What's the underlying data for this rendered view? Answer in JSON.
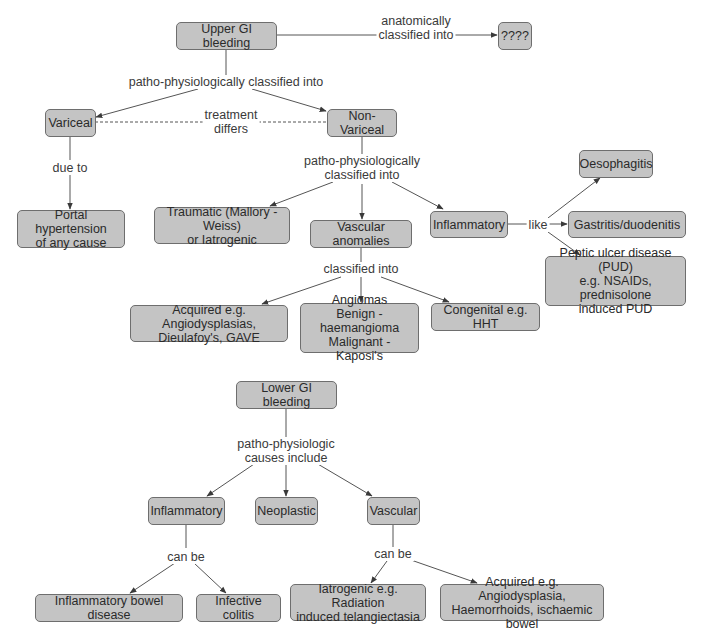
{
  "colors": {
    "node_fill": "#c4c4c4",
    "node_border": "#6e6e6e",
    "edge": "#4a4a4a",
    "text": "#2a2a2a",
    "background": "#ffffff"
  },
  "upper": {
    "nodes": {
      "upper_gi": "Upper GI bleeding",
      "unknown": "????",
      "variceal": "Variceal",
      "non_variceal": "Non-Variceal",
      "portal": "Portal hypertension\nof any cause",
      "traumatic": "Traumatic (Mallory - Weiss)\nor Iatrogenic",
      "vascular_anomalies": "Vascular anomalies",
      "inflammatory": "Inflammatory",
      "oesophagitis": "Oesophagitis",
      "gastritis": "Gastritis/duodenitis",
      "pud": "Peptic ulcer disease (PUD)\ne.g. NSAIDs, prednisolone\ninduced PUD",
      "acquired": "Acquired e.g. Angiodysplasias,\nDieulafoy's, GAVE",
      "angiomas": "Angiomas\nBenign - haemangioma\nMalignant - Kaposi's",
      "congenital": "Congenital e.g. HHT"
    },
    "labels": {
      "anatomically": "anatomically\nclassified into",
      "patho1": "patho-physiologically classified into",
      "treatment": "treatment\ndiffers",
      "due_to": "due to",
      "patho2": "patho-physiologically\nclassified into",
      "like": "like",
      "classified": "classified into"
    }
  },
  "lower": {
    "nodes": {
      "lower_gi": "Lower GI bleeding",
      "inflammatory": "Inflammatory",
      "neoplastic": "Neoplastic",
      "vascular": "Vascular",
      "ibd": "Inflammatory bowel disease",
      "infective": "Infective colitis",
      "iatrogenic": "Iatrogenic e.g. Radiation\ninduced telangiectasia",
      "acquired": "Acquired e.g. Angiodysplasia,\nHaemorrhoids, ischaemic bowel"
    },
    "labels": {
      "patho": "patho-physiologic\ncauses include",
      "can_be_1": "can be",
      "can_be_2": "can be"
    }
  }
}
